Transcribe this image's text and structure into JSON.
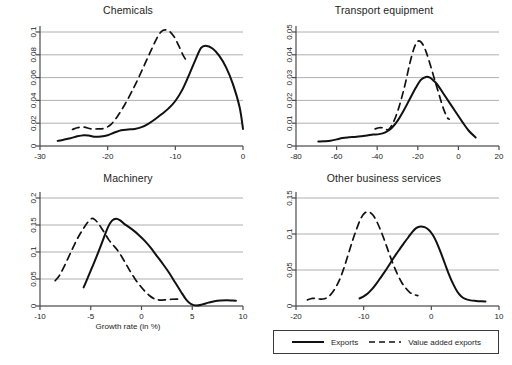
{
  "figure": {
    "width": 512,
    "height": 365,
    "background": "#ffffff",
    "axis_color": "#4a4a4a",
    "grid_color": "#9a9a9a",
    "text_color": "#1d1d1d"
  },
  "legend": {
    "name": "series-legend",
    "position": "bottom-right",
    "entries": [
      {
        "label": "Exports",
        "style": "solid",
        "color": "#111111"
      },
      {
        "label": "Value added exports",
        "style": "dashed",
        "color": "#111111"
      }
    ]
  },
  "shared": {
    "xlabel": "Growth rate (in %)",
    "ylabel": ""
  },
  "chart_data": [
    {
      "type": "line",
      "title": "Chemicals",
      "panel": "top-left",
      "xlabel": "",
      "ylabel": "",
      "xlim": [
        -30,
        0
      ],
      "ylim": [
        0,
        0.1
      ],
      "xticks": [
        -30,
        -20,
        -10,
        0
      ],
      "yticks": [
        0,
        0.02,
        0.04,
        0.06,
        0.08,
        0.1
      ],
      "ytick_labels": [
        "0",
        "0.02",
        "0.04",
        "0.06",
        "0.08",
        "0.1"
      ],
      "xtick_labels": [
        "-30",
        "-20",
        "-10",
        "0"
      ],
      "grid": true,
      "legend": "shared-bottom-right",
      "series": [
        {
          "name": "Exports",
          "style": "solid",
          "x": [
            -27.4,
            -26.5,
            -25.5,
            -24.5,
            -23.5,
            -22.8,
            -22.0,
            -21.0,
            -20.0,
            -19.0,
            -18.0,
            -17.0,
            -16.0,
            -15.0,
            -14.0,
            -13.0,
            -12.0,
            -11.0,
            -10.0,
            -9.0,
            -8.0,
            -7.0,
            -6.2,
            -5.5,
            -4.5,
            -3.5,
            -2.5,
            -1.5,
            -0.5,
            0.0
          ],
          "y": [
            0.0045,
            0.0055,
            0.0068,
            0.0085,
            0.0095,
            0.0092,
            0.0082,
            0.0084,
            0.0095,
            0.0118,
            0.0138,
            0.0145,
            0.015,
            0.0165,
            0.0195,
            0.0235,
            0.028,
            0.033,
            0.0395,
            0.049,
            0.062,
            0.076,
            0.086,
            0.088,
            0.0855,
            0.079,
            0.069,
            0.0545,
            0.034,
            0.015
          ]
        },
        {
          "name": "Value added exports",
          "style": "dashed",
          "x": [
            -25.2,
            -24.5,
            -23.5,
            -22.5,
            -21.5,
            -20.5,
            -19.5,
            -18.5,
            -17.5,
            -16.5,
            -15.5,
            -14.5,
            -13.5,
            -12.5,
            -11.8,
            -11.0,
            -10.2,
            -9.5,
            -8.8,
            -8.2
          ],
          "y": [
            0.0145,
            0.016,
            0.0165,
            0.015,
            0.015,
            0.0155,
            0.019,
            0.0265,
            0.036,
            0.047,
            0.059,
            0.072,
            0.085,
            0.097,
            0.1015,
            0.101,
            0.096,
            0.088,
            0.079,
            0.074
          ]
        }
      ]
    },
    {
      "type": "line",
      "title": "Transport equipment",
      "panel": "top-right",
      "xlabel": "",
      "ylabel": "",
      "xlim": [
        -80,
        20
      ],
      "ylim": [
        0,
        0.05
      ],
      "xticks": [
        -80,
        -60,
        -40,
        -20,
        0,
        20
      ],
      "yticks": [
        0,
        0.01,
        0.02,
        0.03,
        0.04,
        0.05
      ],
      "ytick_labels": [
        "0",
        "0.01",
        "0.02",
        "0.03",
        "0.04",
        "0.05"
      ],
      "xtick_labels": [
        "-80",
        "-60",
        "-40",
        "-20",
        "0",
        "20"
      ],
      "grid": true,
      "legend": "shared-bottom-right",
      "series": [
        {
          "name": "Exports",
          "style": "solid",
          "x": [
            -69.0,
            -66.0,
            -63.0,
            -60.0,
            -57.0,
            -54.0,
            -51.0,
            -48.0,
            -45.0,
            -42.0,
            -39.0,
            -36.0,
            -33.0,
            -30.0,
            -27.0,
            -24.0,
            -21.0,
            -18.5,
            -16.0,
            -14.0,
            -12.0,
            -10.0,
            -7.0,
            -4.0,
            -1.0,
            2.0,
            5.0,
            8.5
          ],
          "y": [
            0.002,
            0.0021,
            0.0023,
            0.0029,
            0.0035,
            0.0038,
            0.004,
            0.0043,
            0.0046,
            0.005,
            0.0052,
            0.006,
            0.0078,
            0.011,
            0.0155,
            0.0205,
            0.0255,
            0.029,
            0.0303,
            0.03,
            0.0285,
            0.0265,
            0.0225,
            0.0185,
            0.0145,
            0.0105,
            0.0068,
            0.0037
          ]
        },
        {
          "name": "Value added exports",
          "style": "dashed",
          "x": [
            -41.0,
            -39.0,
            -37.0,
            -35.5,
            -34.0,
            -32.0,
            -30.0,
            -28.0,
            -26.0,
            -24.0,
            -22.0,
            -20.5,
            -19.0,
            -17.5,
            -16.0,
            -14.5,
            -13.0,
            -11.5,
            -10.0,
            -8.5,
            -7.0,
            -5.5,
            -4.5
          ],
          "y": [
            0.0075,
            0.008,
            0.0079,
            0.0072,
            0.0075,
            0.0105,
            0.015,
            0.021,
            0.028,
            0.036,
            0.0425,
            0.0455,
            0.046,
            0.0445,
            0.0415,
            0.0375,
            0.033,
            0.0285,
            0.024,
            0.0195,
            0.0155,
            0.0125,
            0.0118
          ]
        }
      ]
    },
    {
      "type": "line",
      "title": "Machinery",
      "panel": "bottom-left",
      "xlabel": "Growth rate (in %)",
      "ylabel": "",
      "xlim": [
        -10,
        10
      ],
      "ylim": [
        0,
        0.2
      ],
      "xticks": [
        -10,
        -5,
        0,
        5,
        10
      ],
      "yticks": [
        0,
        0.05,
        0.1,
        0.15,
        0.2
      ],
      "ytick_labels": [
        "0",
        "0.05",
        "0.1",
        "0.15",
        "0.2"
      ],
      "xtick_labels": [
        "-10",
        "-5",
        "0",
        "5",
        "10"
      ],
      "grid": true,
      "legend": "shared-bottom-right",
      "series": [
        {
          "name": "Exports",
          "style": "solid",
          "x": [
            -5.7,
            -5.3,
            -4.9,
            -4.5,
            -4.1,
            -3.7,
            -3.3,
            -2.9,
            -2.5,
            -2.1,
            -1.7,
            -1.3,
            -0.8,
            -0.3,
            0.3,
            0.9,
            1.5,
            2.1,
            2.7,
            3.3,
            3.9,
            4.4,
            4.9,
            5.4,
            6.0,
            6.6,
            7.2,
            7.8,
            8.4,
            9.0,
            9.3
          ],
          "y": [
            0.0345,
            0.052,
            0.07,
            0.088,
            0.107,
            0.127,
            0.146,
            0.158,
            0.1615,
            0.1585,
            0.152,
            0.147,
            0.14,
            0.132,
            0.121,
            0.108,
            0.093,
            0.078,
            0.062,
            0.044,
            0.026,
            0.012,
            0.0035,
            0.001,
            0.003,
            0.0062,
            0.0088,
            0.01,
            0.0105,
            0.01,
            0.0098
          ]
        },
        {
          "name": "Value added exports",
          "style": "dashed",
          "x": [
            -8.5,
            -8.1,
            -7.7,
            -7.3,
            -6.9,
            -6.5,
            -6.1,
            -5.7,
            -5.3,
            -4.9,
            -4.6,
            -4.3,
            -4.0,
            -3.6,
            -3.2,
            -2.8,
            -2.4,
            -2.0,
            -1.6,
            -1.2,
            -0.7,
            -0.2,
            0.3,
            0.8,
            1.3,
            1.8,
            2.4,
            3.0,
            3.6,
            4.0
          ],
          "y": [
            0.047,
            0.056,
            0.07,
            0.086,
            0.102,
            0.118,
            0.132,
            0.144,
            0.155,
            0.162,
            0.16,
            0.154,
            0.146,
            0.134,
            0.122,
            0.113,
            0.104,
            0.093,
            0.08,
            0.067,
            0.052,
            0.039,
            0.028,
            0.019,
            0.013,
            0.011,
            0.0115,
            0.0125,
            0.0128,
            0.012
          ]
        }
      ]
    },
    {
      "type": "line",
      "title": "Other business services",
      "panel": "bottom-right",
      "xlabel": "",
      "ylabel": "",
      "xlim": [
        -20,
        10
      ],
      "ylim": [
        0,
        0.15
      ],
      "xticks": [
        -20,
        -10,
        0,
        10
      ],
      "yticks": [
        0,
        0.05,
        0.1,
        0.15
      ],
      "ytick_labels": [
        "0",
        "0.05",
        "0.1",
        "0.15"
      ],
      "xtick_labels": [
        "-20",
        "-10",
        "0",
        "10"
      ],
      "grid": true,
      "legend": "shared-bottom-right",
      "series": [
        {
          "name": "Exports",
          "style": "solid",
          "x": [
            -10.6,
            -10.0,
            -9.4,
            -8.8,
            -8.2,
            -7.6,
            -7.0,
            -6.4,
            -5.8,
            -5.2,
            -4.6,
            -4.0,
            -3.4,
            -2.8,
            -2.2,
            -1.6,
            -1.0,
            -0.4,
            0.2,
            0.8,
            1.4,
            2.0,
            2.6,
            3.2,
            3.8,
            4.4,
            5.0,
            5.8,
            6.6,
            7.4,
            8.0
          ],
          "y": [
            0.0105,
            0.0135,
            0.0175,
            0.023,
            0.03,
            0.038,
            0.046,
            0.0545,
            0.0635,
            0.072,
            0.08,
            0.088,
            0.0955,
            0.103,
            0.1085,
            0.1105,
            0.1095,
            0.106,
            0.099,
            0.088,
            0.074,
            0.059,
            0.044,
            0.031,
            0.0205,
            0.0135,
            0.0098,
            0.0078,
            0.007,
            0.0065,
            0.0063
          ]
        },
        {
          "name": "Value added exports",
          "style": "dashed",
          "x": [
            -18.3,
            -17.6,
            -17.0,
            -16.4,
            -15.8,
            -15.2,
            -14.6,
            -14.0,
            -13.4,
            -12.8,
            -12.2,
            -11.6,
            -11.0,
            -10.4,
            -9.8,
            -9.2,
            -8.6,
            -8.0,
            -7.4,
            -6.8,
            -6.2,
            -5.6,
            -5.0,
            -4.4,
            -3.8,
            -3.2,
            -2.6,
            -2.0
          ],
          "y": [
            0.0085,
            0.0105,
            0.0105,
            0.0095,
            0.01,
            0.013,
            0.019,
            0.028,
            0.04,
            0.056,
            0.074,
            0.092,
            0.108,
            0.122,
            0.1295,
            0.1305,
            0.126,
            0.116,
            0.103,
            0.088,
            0.072,
            0.057,
            0.044,
            0.033,
            0.025,
            0.019,
            0.016,
            0.0145
          ]
        }
      ]
    }
  ]
}
